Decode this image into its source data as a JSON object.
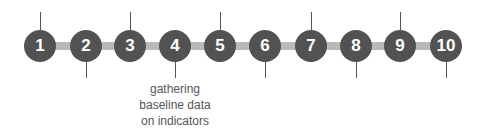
{
  "timeline": {
    "steps": [
      {
        "number": "1",
        "x": 40,
        "tick": "up"
      },
      {
        "number": "2",
        "x": 86,
        "tick": "down"
      },
      {
        "number": "3",
        "x": 130,
        "tick": "up"
      },
      {
        "number": "4",
        "x": 175,
        "tick": "down",
        "label": "gathering baseline data on indicators"
      },
      {
        "number": "5",
        "x": 220,
        "tick": "up"
      },
      {
        "number": "6",
        "x": 265,
        "tick": "down"
      },
      {
        "number": "7",
        "x": 311,
        "tick": "up"
      },
      {
        "number": "8",
        "x": 356,
        "tick": "down"
      },
      {
        "number": "9",
        "x": 400,
        "tick": "up"
      },
      {
        "number": "10",
        "x": 446,
        "tick": "down"
      }
    ],
    "label_lines": [
      "gathering",
      "baseline data",
      "on indicators"
    ],
    "colors": {
      "node": "#525252",
      "bar": "#b9b9b9",
      "text": "#555555"
    }
  }
}
